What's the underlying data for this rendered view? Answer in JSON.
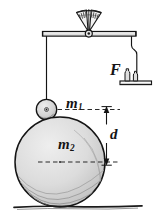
{
  "figure": {
    "labels": {
      "mass_small": "m",
      "mass_small_sub": "1",
      "mass_large": "m",
      "mass_large_sub": "2",
      "distance": "d",
      "force": "F"
    },
    "colors": {
      "ink": "#141414",
      "sphere_fill": "#d8d8d8",
      "sphere_fill_light": "#e6e6e6",
      "ball_fill": "#d0d0d0",
      "background": "#ffffff",
      "gauge_fill": "#efefef"
    },
    "parts": {
      "gauge": "fan-scale-gauge",
      "beam": "horizontal-support-beam",
      "pivot": "beam-pivot",
      "wire_left": "left-suspension-wire",
      "wire_right": "right-suspension-wire",
      "ball_small": "small-mass-sphere",
      "sphere_large": "large-mass-sphere",
      "pan": "weight-pan",
      "weights": "calibration-weights",
      "dimension": "distance-dimension-arrow",
      "ground": "ground-line"
    }
  }
}
